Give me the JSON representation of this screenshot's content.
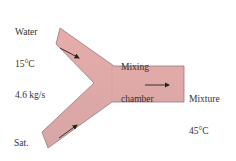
{
  "diagram": {
    "type": "mixing-chamber-schematic",
    "colors": {
      "pipe_fill": "#e3a9a6",
      "pipe_fill_dark": "#cfa3a3",
      "pipe_edge": "#9a7a7a",
      "arrow": "#222222",
      "text": "#333333"
    },
    "inlets": [
      {
        "name": "water-inlet",
        "lines": [
          "Water",
          "15°C",
          "4.6 kg/s"
        ]
      },
      {
        "name": "vapor-inlet",
        "lines": [
          "Sat.",
          "vapor",
          "0.23 kg/s"
        ]
      }
    ],
    "chamber": {
      "lines": [
        "Mixing",
        "chamber"
      ]
    },
    "outlet": {
      "name": "mixture-outlet",
      "lines": [
        "Mixture",
        "45°C"
      ]
    }
  }
}
